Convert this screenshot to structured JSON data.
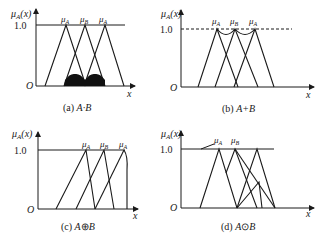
{
  "figure": {
    "panels": [
      {
        "id": "a",
        "y_label": "μA(x)",
        "y_tick": "1.0",
        "origin": "O",
        "x_label": "x",
        "peak_labels": [
          "μA",
          "μB",
          "μA"
        ],
        "caption": "(a) A·B",
        "operation": "algebraic product"
      },
      {
        "id": "b",
        "y_label": "μA(x)",
        "y_tick": "1.0",
        "origin": "O",
        "x_label": "x",
        "peak_labels": [
          "μA",
          "μB",
          "μA"
        ],
        "caption": "(b) A+B",
        "operation": "algebraic sum"
      },
      {
        "id": "c",
        "y_label": "μA(x)",
        "y_tick": "1.0",
        "origin": "O",
        "x_label": "x",
        "peak_labels": [
          "μA",
          "μB",
          "μA"
        ],
        "caption": "(c) A⊕B",
        "operation": "bounded sum"
      },
      {
        "id": "d",
        "y_label": "μA(x)",
        "y_tick": "1.0",
        "origin": "O",
        "x_label": "x",
        "peak_labels": [
          "μA",
          "μB"
        ],
        "caption": "(d) A⊙B",
        "operation": "bounded product"
      }
    ]
  },
  "text": {
    "mu": "μ",
    "sub_A": "A",
    "sub_B": "B",
    "x_paren": "(x)",
    "one": "1.0",
    "O": "O",
    "x": "x",
    "cap_a_pre": "(a) ",
    "cap_a_expr": "A·B",
    "cap_b_pre": "(b) ",
    "cap_b_expr": "A+B",
    "cap_c_pre": "(c) ",
    "cap_c_A": "A",
    "cap_c_op": "⊕",
    "cap_c_B": "B",
    "cap_d_pre": "(d) ",
    "cap_d_A": "A",
    "cap_d_op": "⊙",
    "cap_d_B": "B"
  }
}
